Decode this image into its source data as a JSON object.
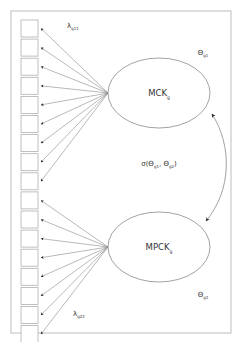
{
  "figure": {
    "frame": {
      "x": 11,
      "y": 11,
      "width": 220,
      "height": 322,
      "stroke": "#bdbdbd"
    },
    "colors": {
      "line": "#8a8a8a",
      "box": "#b0b0b0",
      "text": "#333333"
    }
  },
  "latent_factors": [
    {
      "id": "mck",
      "label": "MCK",
      "subscript": "g",
      "cx": 159,
      "cy": 93,
      "rx": 51,
      "ry": 35,
      "variance_label": "Θ",
      "variance_subscript": "g1",
      "variance_x": 203,
      "variance_y": 55
    },
    {
      "id": "mpck",
      "label": "MPCK",
      "subscript": "g",
      "cx": 159,
      "cy": 247,
      "rx": 51,
      "ry": 35,
      "variance_label": "Θ",
      "variance_subscript": "g2",
      "variance_x": 203,
      "variance_y": 297
    }
  ],
  "indicators": {
    "count": 17,
    "x": 21,
    "y_start": 20,
    "size": 17,
    "pitch": 19.1,
    "groups": [
      {
        "factor": "mck",
        "from": 0,
        "to": 8
      },
      {
        "factor": "mpck",
        "from": 9,
        "to": 16
      }
    ]
  },
  "loading_labels": [
    {
      "symbol": "λ",
      "subscript": "g11",
      "x": 67,
      "y": 28
    },
    {
      "symbol": "λ",
      "subscript": "g22",
      "x": 73,
      "y": 316
    }
  ],
  "covariance": {
    "label": "σ(Θ",
    "sub1": "g1",
    "mid": ", Θ",
    "sub2": "g2",
    "close": ")",
    "x": 159,
    "y": 166
  }
}
